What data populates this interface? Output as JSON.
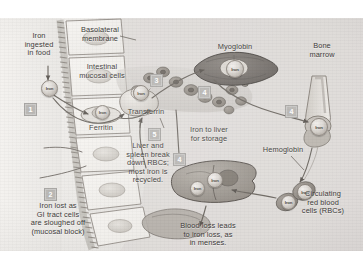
{
  "figure": {
    "background": "#ffffff",
    "plate_tint": "#e7e5e2",
    "step_marker_color": "#b9b7b4"
  },
  "labels": {
    "iron_ingested": "Iron\ningested\nin food",
    "basolateral_membrane": "Basolateral\nmembrane",
    "intestinal_mucosal_cells": "Intestinal\nmucosal cells",
    "ferritin": "Ferritin",
    "iron_lost": "Iron lost as\nGI tract cells\nare sloughed off\n(mucosal block)",
    "transferrin": "Transferrin",
    "myoglobin": "Myoglobin",
    "bone_marrow": "Bone\nmarrow",
    "hemoglobin": "Hemoglobin",
    "circulating_rbcs": "Circulating\nred blood\ncells (RBCs)",
    "iron_to_liver": "Iron to liver\nfor storage",
    "liver_spleen": "Liver and\nspleen break\ndown RBCs;\nmost iron is\nrecycled.",
    "blood_loss": "Blood loss leads\nto iron loss, as\nin menses."
  },
  "steps": {
    "one": "1",
    "two": "2",
    "three": "3",
    "four_muscle": "4",
    "four_marrow": "4",
    "four_liver": "4",
    "five": "5"
  },
  "iron_particles": {
    "food": "Iron",
    "ferritin_bound": "Iron",
    "transferrin_bound": "Iron",
    "myoglobin_bound": "Iron",
    "marrow_bound": "Iron",
    "liver_a": "Iron",
    "liver_b": "Iron",
    "rbc_a": "Iron",
    "rbc_b": "Iron"
  }
}
